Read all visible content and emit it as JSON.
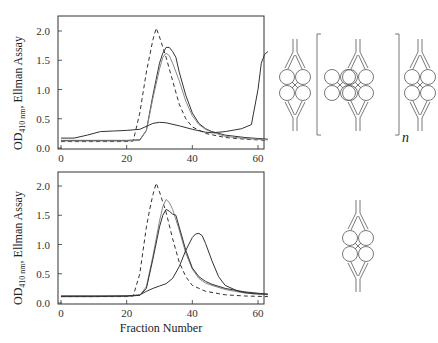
{
  "figure": {
    "xlabel": "Fraction Number",
    "ylabel_main": "OD",
    "ylabel_sub": "410 nm",
    "ylabel_rest": ", Ellman Assay",
    "diagram_subscript": "n"
  },
  "chart_data": [
    {
      "type": "line",
      "title": "",
      "panel": "top",
      "xlabel": "",
      "ylabel": "OD410 nm , Ellman Assay",
      "xlim": [
        0,
        63
      ],
      "ylim": [
        0,
        2.25
      ],
      "xticks": [
        0,
        20,
        40,
        60
      ],
      "yticks": [
        0.0,
        0.5,
        1.0,
        1.5,
        2.0
      ],
      "ytick_labels": [
        "0.0",
        "0.5",
        "1.0",
        "1.5",
        "2.0"
      ],
      "xtick_labels": [
        "0",
        "20",
        "40",
        "60"
      ],
      "grid": false,
      "legend": null,
      "series": [
        {
          "name": "dashed",
          "style": "dashed",
          "x": [
            0,
            10,
            20,
            22,
            24,
            26,
            28,
            29,
            30,
            32,
            34,
            36,
            38,
            40,
            44,
            50,
            56,
            63
          ],
          "y": [
            0.11,
            0.11,
            0.11,
            0.12,
            0.6,
            1.3,
            1.85,
            2.05,
            1.9,
            1.55,
            1.15,
            0.75,
            0.5,
            0.36,
            0.25,
            0.18,
            0.15,
            0.13
          ]
        },
        {
          "name": "solid-a",
          "style": "solid",
          "x": [
            0,
            10,
            20,
            24,
            26,
            28,
            30,
            31,
            32,
            33,
            34,
            35,
            36,
            38,
            40,
            42,
            44,
            46,
            50,
            56,
            63
          ],
          "y": [
            0.13,
            0.13,
            0.13,
            0.14,
            0.3,
            0.9,
            1.45,
            1.62,
            1.72,
            1.72,
            1.65,
            1.55,
            1.3,
            0.9,
            0.6,
            0.42,
            0.33,
            0.28,
            0.22,
            0.18,
            0.15
          ]
        },
        {
          "name": "solid-b",
          "style": "solid-grey",
          "x": [
            0,
            10,
            20,
            24,
            26,
            28,
            30,
            31,
            32,
            33,
            34,
            36,
            38,
            40,
            42,
            44,
            46,
            50,
            56,
            63
          ],
          "y": [
            0.12,
            0.12,
            0.12,
            0.13,
            0.3,
            0.85,
            1.35,
            1.55,
            1.62,
            1.58,
            1.45,
            1.15,
            0.8,
            0.55,
            0.4,
            0.32,
            0.27,
            0.2,
            0.16,
            0.14
          ]
        },
        {
          "name": "solid-c",
          "style": "solid",
          "x": [
            0,
            4,
            8,
            12,
            16,
            20,
            24,
            28,
            30,
            32,
            36,
            40,
            44,
            46,
            50,
            55,
            58,
            60,
            61,
            62,
            63
          ],
          "y": [
            0.17,
            0.17,
            0.22,
            0.28,
            0.29,
            0.3,
            0.32,
            0.42,
            0.44,
            0.43,
            0.38,
            0.32,
            0.27,
            0.26,
            0.28,
            0.33,
            0.4,
            1.0,
            1.45,
            1.6,
            1.65
          ]
        }
      ]
    },
    {
      "type": "line",
      "title": "",
      "panel": "bottom",
      "xlabel": "Fraction Number",
      "ylabel": "OD410 nm , Ellman Assay",
      "xlim": [
        0,
        63
      ],
      "ylim": [
        0,
        2.25
      ],
      "xticks": [
        0,
        20,
        40,
        60
      ],
      "yticks": [
        0.0,
        0.5,
        1.0,
        1.5,
        2.0
      ],
      "ytick_labels": [
        "0.0",
        "0.5",
        "1.0",
        "1.5",
        "2.0"
      ],
      "xtick_labels": [
        "0",
        "20",
        "40",
        "60"
      ],
      "grid": false,
      "legend": null,
      "series": [
        {
          "name": "dashed",
          "style": "dashed",
          "x": [
            0,
            10,
            20,
            22,
            24,
            26,
            27,
            28,
            29,
            30,
            32,
            34,
            36,
            38,
            40,
            44,
            50,
            56,
            63
          ],
          "y": [
            0.11,
            0.11,
            0.11,
            0.12,
            0.5,
            1.3,
            1.6,
            1.85,
            2.05,
            1.9,
            1.55,
            1.1,
            0.7,
            0.45,
            0.3,
            0.2,
            0.14,
            0.12,
            0.11
          ]
        },
        {
          "name": "solid-a",
          "style": "solid-grey",
          "x": [
            0,
            10,
            20,
            24,
            26,
            28,
            30,
            31,
            32,
            33,
            34,
            36,
            38,
            40,
            42,
            44,
            46,
            50,
            56,
            63
          ],
          "y": [
            0.12,
            0.12,
            0.12,
            0.13,
            0.28,
            0.8,
            1.4,
            1.65,
            1.77,
            1.72,
            1.6,
            1.25,
            0.85,
            0.58,
            0.42,
            0.34,
            0.3,
            0.23,
            0.17,
            0.14
          ]
        },
        {
          "name": "solid-b",
          "style": "solid",
          "x": [
            0,
            10,
            20,
            24,
            26,
            28,
            30,
            31,
            32,
            33,
            34,
            35,
            36,
            38,
            40,
            42,
            44,
            46,
            50,
            56,
            63
          ],
          "y": [
            0.12,
            0.12,
            0.12,
            0.13,
            0.25,
            0.75,
            1.3,
            1.5,
            1.6,
            1.57,
            1.52,
            1.5,
            1.3,
            0.9,
            0.6,
            0.45,
            0.37,
            0.32,
            0.25,
            0.19,
            0.15
          ]
        },
        {
          "name": "solid-c",
          "style": "solid",
          "x": [
            0,
            10,
            20,
            24,
            26,
            28,
            30,
            32,
            34,
            36,
            38,
            40,
            41,
            42,
            43,
            44,
            46,
            48,
            50,
            54,
            58,
            63
          ],
          "y": [
            0.11,
            0.11,
            0.12,
            0.14,
            0.2,
            0.25,
            0.29,
            0.33,
            0.42,
            0.62,
            0.9,
            1.12,
            1.18,
            1.19,
            1.15,
            1.02,
            0.72,
            0.45,
            0.3,
            0.2,
            0.16,
            0.15
          ]
        }
      ]
    }
  ]
}
